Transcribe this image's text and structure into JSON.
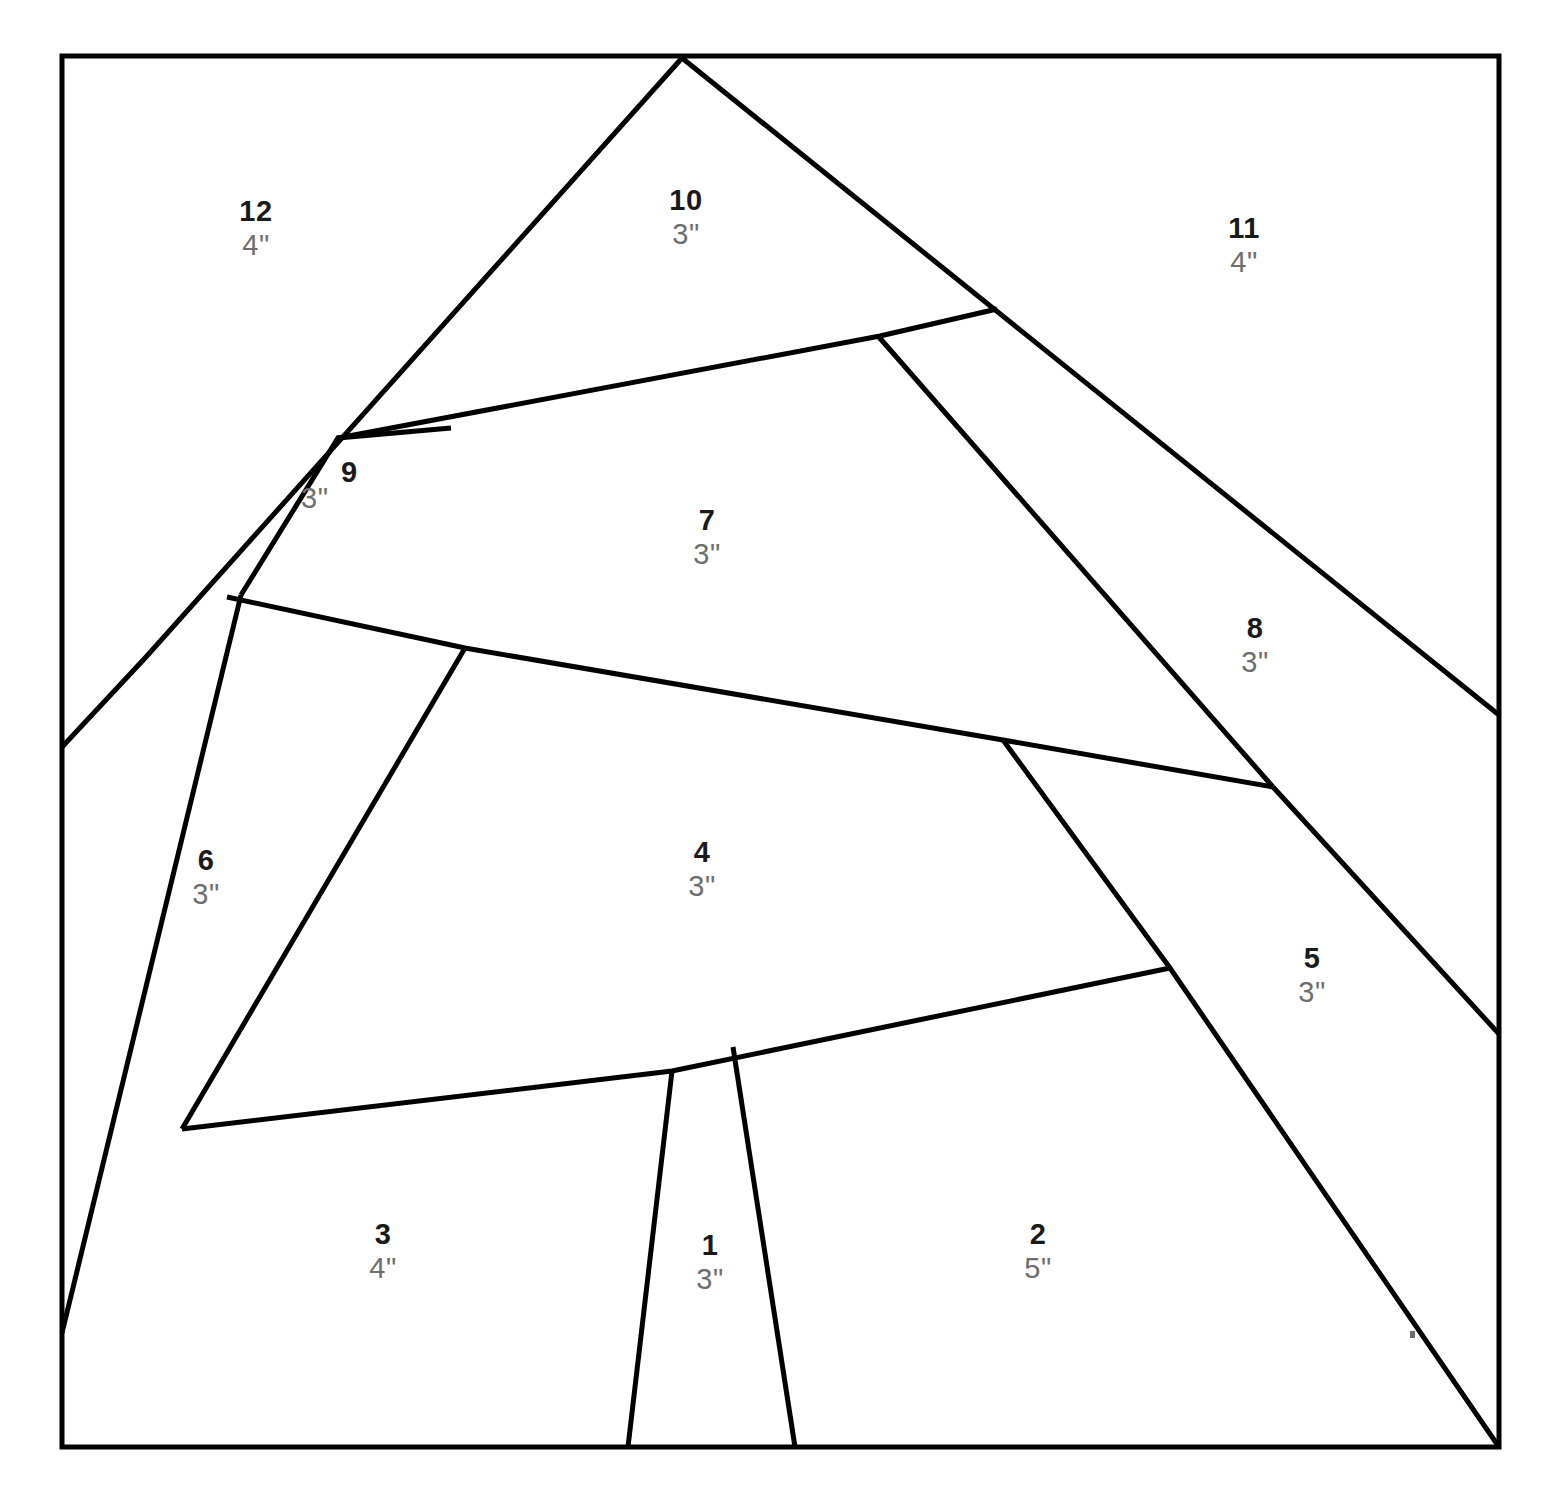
{
  "document": {
    "kind": "foundation-paper-piecing-pattern",
    "background_color": "#ffffff",
    "line_color": "#000000",
    "number_color": "#1a1a1a",
    "size_color": "#6e6e6e"
  },
  "frame": {
    "x": 62,
    "y": 56,
    "width": 1437,
    "height": 1391
  },
  "pieces": [
    {
      "id": "1",
      "number": "1",
      "size": "3\"",
      "label_x": 710,
      "label_y": 1262
    },
    {
      "id": "2",
      "number": "2",
      "size": "5\"",
      "label_x": 1038,
      "label_y": 1251
    },
    {
      "id": "3",
      "number": "3",
      "size": "4\"",
      "label_x": 383,
      "label_y": 1251
    },
    {
      "id": "4",
      "number": "4",
      "size": "3\"",
      "label_x": 702,
      "label_y": 869
    },
    {
      "id": "5",
      "number": "5",
      "size": "3\"",
      "label_x": 1312,
      "label_y": 975
    },
    {
      "id": "6",
      "number": "6",
      "size": "3\"",
      "label_x": 206,
      "label_y": 877
    },
    {
      "id": "7",
      "number": "7",
      "size": "3\"",
      "label_x": 707,
      "label_y": 537
    },
    {
      "id": "8",
      "number": "8",
      "size": "3\"",
      "label_x": 1255,
      "label_y": 645
    },
    {
      "id": "9",
      "number": "9",
      "size": "3\"",
      "label_x": 345,
      "label_y": 475,
      "inline": true
    },
    {
      "id": "10",
      "number": "10",
      "size": "3\"",
      "label_x": 686,
      "label_y": 217
    },
    {
      "id": "11",
      "number": "11",
      "size": "4\"",
      "label_x": 1244,
      "label_y": 245
    },
    {
      "id": "12",
      "number": "12",
      "size": "4\"",
      "label_x": 256,
      "label_y": 228
    }
  ],
  "seams": [
    {
      "name": "apex-left-long-diagonal",
      "points": "682,58 146,657 62,747"
    },
    {
      "name": "apex-right-long-diagonal",
      "points": "682,58 1499,715"
    },
    {
      "name": "seam-9-over-12",
      "points": "241,595 338,438 451,428"
    },
    {
      "name": "seam-9-7-top",
      "points": "338,438 880,336 997,309"
    },
    {
      "name": "seam-7-8-divider",
      "points": "878,336 1273,787"
    },
    {
      "name": "seam-7-4-boundary",
      "points": "227,597 465,648 1003,740 1273,787"
    },
    {
      "name": "seam-6-4-divider",
      "points": "465,648 182,1129"
    },
    {
      "name": "seam-6-outer-left",
      "points": "241,595 62,1333"
    },
    {
      "name": "seam-3-4-boundary",
      "points": "182,1129 672,1071 1170,968"
    },
    {
      "name": "seam-4-5-divider",
      "points": "1003,740 1170,968 1499,1447"
    },
    {
      "name": "seam-8-5-divider",
      "points": "1273,787 1499,1034"
    },
    {
      "name": "seam-1-left",
      "points": "672,1071 628,1447"
    },
    {
      "name": "seam-1-right",
      "points": "733,1047 795,1447"
    }
  ],
  "artifacts": [
    {
      "name": "stray-speck",
      "x": 1410,
      "y": 1331,
      "w": 5,
      "h": 7
    }
  ]
}
